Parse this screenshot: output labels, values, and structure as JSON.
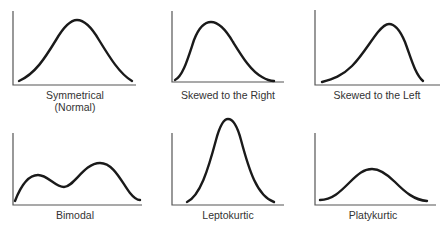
{
  "figure": {
    "panels": [
      {
        "id": "symmetrical",
        "label_line1": "Symmetrical",
        "label_line2": "(Normal)"
      },
      {
        "id": "skewed-right",
        "label_line1": "Skewed to the Right"
      },
      {
        "id": "skewed-left",
        "label_line1": "Skewed to the Left"
      },
      {
        "id": "bimodal",
        "label_line1": "Bimodal"
      },
      {
        "id": "leptokurtic",
        "label_line1": "Leptokurtic"
      },
      {
        "id": "platykurtic",
        "label_line1": "Platykurtic"
      }
    ],
    "colors": {
      "curve": "#1a1a1a",
      "axis": "#555555",
      "text": "#333333",
      "background": "#ffffff"
    }
  }
}
